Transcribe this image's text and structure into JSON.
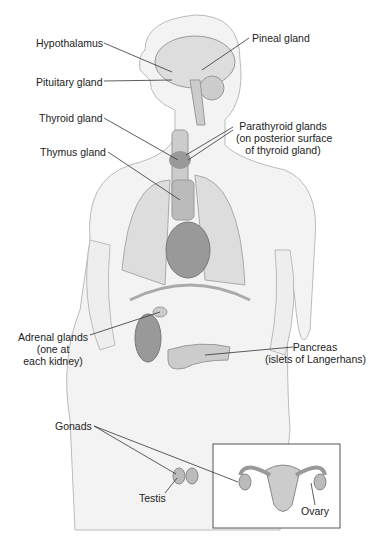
{
  "labels": {
    "hypothalamus": "Hypothalamus",
    "pineal": "Pineal gland",
    "pituitary": "Pituitary gland",
    "thyroid": "Thyroid gland",
    "parathyroid_1": "Parathyroid glands",
    "parathyroid_2": "(on posterior surface",
    "parathyroid_3": "of thyroid gland)",
    "thymus": "Thymus gland",
    "adrenal_1": "Adrenal glands",
    "adrenal_2": "(one at",
    "adrenal_3": "each kidney)",
    "pancreas_1": "Pancreas",
    "pancreas_2": "(islets of Langerhans)",
    "gonads": "Gonads",
    "testis": "Testis",
    "ovary": "Ovary"
  }
}
